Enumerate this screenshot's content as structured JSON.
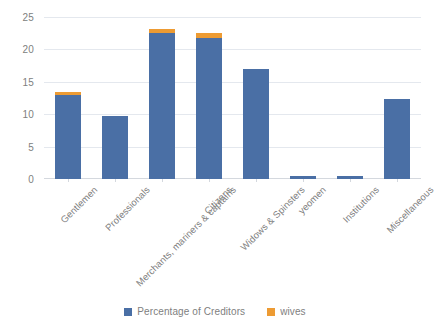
{
  "chart_data": {
    "type": "bar",
    "stacked": true,
    "title": "",
    "xlabel": "",
    "ylabel": "",
    "ylim": [
      0,
      25
    ],
    "yticks": [
      0,
      5,
      10,
      15,
      20,
      25
    ],
    "grid": true,
    "legend_position": "bottom",
    "categories": [
      "Gentlemen",
      "Professionals",
      "Merchants, mariners & captains",
      "Citizens",
      "Widows & Spinsters",
      "yeomen",
      "Institutions",
      "Miscellaneous"
    ],
    "series": [
      {
        "name": "Percentage of Creditors",
        "color": "#4a6fa5",
        "values": [
          12.9,
          9.7,
          22.6,
          21.8,
          17.0,
          0.4,
          0.4,
          12.3
        ]
      },
      {
        "name": "wives",
        "color": "#ed9b33",
        "values": [
          0.5,
          0,
          0.6,
          0.8,
          0,
          0,
          0,
          0
        ]
      }
    ],
    "totals": [
      13.4,
      9.7,
      23.2,
      22.6,
      17.0,
      0.4,
      0.4,
      12.3
    ]
  },
  "legend": {
    "items": [
      {
        "label": "Percentage of Creditors",
        "color": "#4a6fa5"
      },
      {
        "label": "wives",
        "color": "#ed9b33"
      }
    ]
  },
  "colors": {
    "creditors_blue": "#4a6fa5",
    "wives_orange": "#ed9b33",
    "gridline": "#e4e8ee",
    "axis_text": "#808080",
    "background": "#ffffff"
  }
}
